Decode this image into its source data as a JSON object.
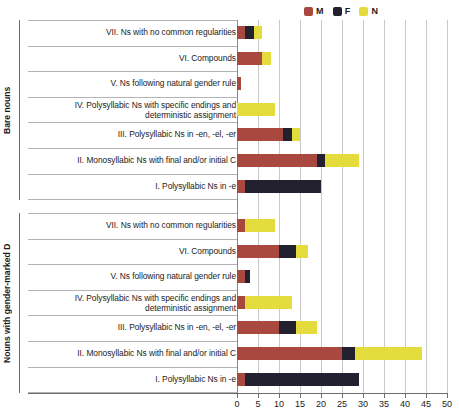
{
  "chart_data": {
    "type": "bar",
    "orientation": "horizontal",
    "stacked": true,
    "title": "",
    "xlabel": "",
    "ylabel": "",
    "xlim": [
      0,
      50
    ],
    "xticks": [
      0,
      5,
      10,
      15,
      20,
      25,
      30,
      35,
      40,
      45,
      50
    ],
    "xtick_labels": [
      "0",
      "5",
      "10",
      "15",
      "20",
      "25",
      "30",
      "35",
      "40",
      "45",
      "50"
    ],
    "grid": true,
    "legend_position": "top-right",
    "series": [
      {
        "name": "M",
        "color": "#a8483f"
      },
      {
        "name": "F",
        "color": "#23202f"
      },
      {
        "name": "N",
        "color": "#e3dc3c"
      }
    ],
    "groups": [
      {
        "axis_label": "Bare nouns",
        "categories": [
          "VII. Ns with no common regularities",
          "VI. Compounds",
          "V. Ns following natural gender rule",
          "IV. Polysyllabic Ns with specific endings and deterministic assignment",
          "III. Polysyllabic Ns in -en, -el, -er",
          "II. Monosyllabic Ns with final and/or initial C",
          "I. Polysyllabic Ns in -e"
        ],
        "values": {
          "M": [
            2,
            6,
            1,
            0,
            11,
            19,
            2
          ],
          "F": [
            2,
            0,
            0,
            0,
            2,
            2,
            18
          ],
          "N": [
            2,
            2,
            0,
            9,
            2,
            8,
            0
          ]
        }
      },
      {
        "axis_label": "Nouns with gender-marked D",
        "categories": [
          "VII. Ns with no common regularities",
          "VI. Compounds",
          "V. Ns following natural gender rule",
          "IV. Polysyllabic Ns with specific endings and deterministic assignment",
          "III. Polysyllabic Ns in -en, -el, -er",
          "II. Monosyllabic Ns with final and/or initial C",
          "I. Polysyllabic Ns in -e"
        ],
        "values": {
          "M": [
            2,
            10,
            2,
            2,
            10,
            25,
            2
          ],
          "F": [
            0,
            4,
            1,
            0,
            4,
            3,
            27
          ],
          "N": [
            7,
            3,
            0,
            11,
            5,
            16,
            0
          ]
        }
      }
    ]
  },
  "legend": {
    "items": [
      {
        "label": "M",
        "color": "#a8483f"
      },
      {
        "label": "F",
        "color": "#23202f"
      },
      {
        "label": "N",
        "color": "#e3dc3c"
      }
    ]
  }
}
